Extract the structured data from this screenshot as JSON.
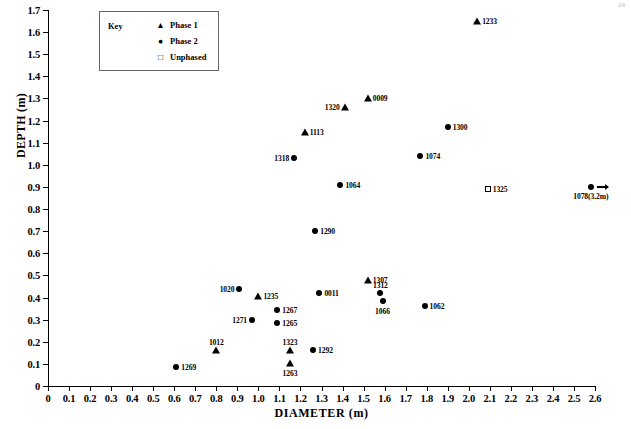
{
  "chart_data": {
    "type": "scatter",
    "title": "",
    "xlabel": "DIAMETER (m)",
    "ylabel": "DEPTH (m)",
    "xlim": [
      0,
      2.6
    ],
    "ylim": [
      0,
      1.7
    ],
    "xticks": [
      "0",
      "0.1",
      "0.2",
      "0.3",
      "0.4",
      "0.5",
      "0.6",
      "0.7",
      "0.8",
      "0.9",
      "1.0",
      "1.1",
      "1.2",
      "1.3",
      "1.4",
      "1.5",
      "1.6",
      "1.7",
      "1.8",
      "1.9",
      "2.0",
      "2.1",
      "2.2",
      "2.3",
      "2.4",
      "2.5",
      "2.6"
    ],
    "yticks": [
      "0",
      "0.1",
      "0.2",
      "0.3",
      "0.4",
      "0.5",
      "0.6",
      "0.7",
      "0.8",
      "0.9",
      "1.0",
      "1.1",
      "1.2",
      "1.3",
      "1.4",
      "1.5",
      "1.6",
      "1.7"
    ],
    "grid": false,
    "legend_position": "top-left-inside",
    "series": [
      {
        "name": "Phase 1",
        "marker": "triangle",
        "color": "#000000"
      },
      {
        "name": "Phase 2",
        "marker": "circle",
        "color": "#000000"
      },
      {
        "name": "Unphased",
        "marker": "open-square",
        "color": "#000000"
      }
    ],
    "points": [
      {
        "label": "1233",
        "x": 2.04,
        "y": 1.65,
        "series": "Phase 1",
        "label_pos": "right"
      },
      {
        "label": "0009",
        "x": 1.52,
        "y": 1.3,
        "series": "Phase 1",
        "label_pos": "right"
      },
      {
        "label": "1320",
        "x": 1.41,
        "y": 1.26,
        "series": "Phase 1",
        "label_pos": "left"
      },
      {
        "label": "1300",
        "x": 1.9,
        "y": 1.17,
        "series": "Phase 2",
        "label_pos": "right"
      },
      {
        "label": "1113",
        "x": 1.22,
        "y": 1.15,
        "series": "Phase 1",
        "label_pos": "right"
      },
      {
        "label": "1074",
        "x": 1.77,
        "y": 1.04,
        "series": "Phase 2",
        "label_pos": "right"
      },
      {
        "label": "1318",
        "x": 1.17,
        "y": 1.03,
        "series": "Phase 2",
        "label_pos": "left"
      },
      {
        "label": "1064",
        "x": 1.39,
        "y": 0.91,
        "series": "Phase 2",
        "label_pos": "right"
      },
      {
        "label": "1325",
        "x": 2.09,
        "y": 0.89,
        "series": "Unphased",
        "label_pos": "right"
      },
      {
        "label": "1078(3.2m)",
        "x": 2.58,
        "y": 0.9,
        "series": "Phase 2",
        "label_pos": "below-arrow"
      },
      {
        "label": "1290",
        "x": 1.27,
        "y": 0.7,
        "series": "Phase 2",
        "label_pos": "right"
      },
      {
        "label": "1307",
        "x": 1.52,
        "y": 0.48,
        "series": "Phase 1",
        "label_pos": "right"
      },
      {
        "label": "1020",
        "x": 0.91,
        "y": 0.44,
        "series": "Phase 2",
        "label_pos": "left"
      },
      {
        "label": "0011",
        "x": 1.29,
        "y": 0.42,
        "series": "Phase 2",
        "label_pos": "right"
      },
      {
        "label": "1312",
        "x": 1.58,
        "y": 0.42,
        "series": "Phase 2",
        "label_pos": "above"
      },
      {
        "label": "1235",
        "x": 1.0,
        "y": 0.405,
        "series": "Phase 1",
        "label_pos": "right"
      },
      {
        "label": "1066",
        "x": 1.59,
        "y": 0.385,
        "series": "Phase 2",
        "label_pos": "below"
      },
      {
        "label": "1062",
        "x": 1.79,
        "y": 0.36,
        "series": "Phase 2",
        "label_pos": "right"
      },
      {
        "label": "1267",
        "x": 1.09,
        "y": 0.345,
        "series": "Phase 2",
        "label_pos": "right"
      },
      {
        "label": "1271",
        "x": 0.97,
        "y": 0.3,
        "series": "Phase 2",
        "label_pos": "left"
      },
      {
        "label": "1265",
        "x": 1.09,
        "y": 0.285,
        "series": "Phase 2",
        "label_pos": "right"
      },
      {
        "label": "1323",
        "x": 1.15,
        "y": 0.163,
        "series": "Phase 1",
        "label_pos": "above"
      },
      {
        "label": "1292",
        "x": 1.26,
        "y": 0.163,
        "series": "Phase 2",
        "label_pos": "right"
      },
      {
        "label": "1012",
        "x": 0.8,
        "y": 0.165,
        "series": "Phase 1",
        "label_pos": "above"
      },
      {
        "label": "1263",
        "x": 1.15,
        "y": 0.105,
        "series": "Phase 1",
        "label_pos": "below"
      },
      {
        "label": "1269",
        "x": 0.61,
        "y": 0.085,
        "series": "Phase 2",
        "label_pos": "right"
      }
    ]
  },
  "legend": {
    "title": "Key",
    "entries": [
      {
        "label": "Phase 1",
        "symbol": "triangle-icon"
      },
      {
        "label": "Phase 2",
        "symbol": "circle-icon"
      },
      {
        "label": "Unphased",
        "symbol": "open-square-icon"
      }
    ]
  },
  "corner_mark": "24"
}
